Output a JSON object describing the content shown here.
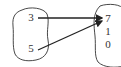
{
  "diagram": {
    "type": "mapping",
    "domain_set": {
      "elements": [
        "3",
        "5"
      ]
    },
    "range_set": {
      "elements": [
        "7",
        "1",
        "0"
      ]
    },
    "arrows": [
      {
        "from": "3",
        "to": "7"
      },
      {
        "from": "5",
        "to": "7"
      }
    ],
    "colors": {
      "stroke": "#333333",
      "background": "#ffffff"
    }
  }
}
